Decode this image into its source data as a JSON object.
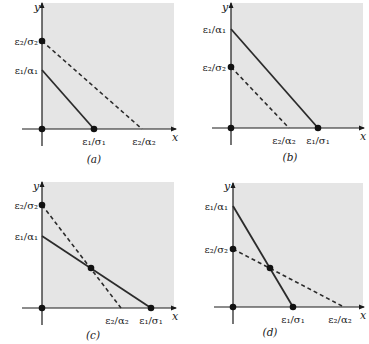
{
  "figure": {
    "background_color": "#ffffff",
    "region_color": "#e5e5e5",
    "line_color": "#2b2b2b",
    "axis_color": "#1a1a1a",
    "x_axis_label": "x",
    "y_axis_label": "y"
  },
  "chart_data": [
    {
      "type": "line",
      "panel": "a",
      "caption": "(a)",
      "xlabel": "x",
      "ylabel": "y",
      "y_tick_labels": [
        "ε₂/σ₂",
        "ε₁/α₁"
      ],
      "x_tick_labels": [
        "ε₁/σ₁",
        "ε₂/α₂"
      ],
      "series": [
        {
          "name": "solid",
          "style": "solid",
          "from": {
            "x": 0,
            "y_label": "ε₁/α₁"
          },
          "to": {
            "x_label": "ε₁/σ₁",
            "y": 0
          }
        },
        {
          "name": "dashed",
          "style": "dashed",
          "from": {
            "x": 0,
            "y_label": "ε₂/σ₂"
          },
          "to": {
            "x_label": "ε₂/α₂",
            "y": 0
          }
        }
      ],
      "dots": [
        "origin",
        "ε₂/σ₂ on y-axis",
        "ε₁/σ₁ on x-axis"
      ]
    },
    {
      "type": "line",
      "panel": "b",
      "caption": "(b)",
      "xlabel": "x",
      "ylabel": "y",
      "y_tick_labels": [
        "ε₁/α₁",
        "ε₂/σ₂"
      ],
      "x_tick_labels": [
        "ε₂/α₂",
        "ε₁/σ₁"
      ],
      "series": [
        {
          "name": "solid",
          "style": "solid",
          "from": {
            "x": 0,
            "y_label": "ε₁/α₁"
          },
          "to": {
            "x_label": "ε₁/σ₁",
            "y": 0
          }
        },
        {
          "name": "dashed",
          "style": "dashed",
          "from": {
            "x": 0,
            "y_label": "ε₂/σ₂"
          },
          "to": {
            "x_label": "ε₂/α₂",
            "y": 0
          }
        }
      ],
      "dots": [
        "origin",
        "ε₂/σ₂ on y-axis",
        "ε₁/σ₁ on x-axis"
      ]
    },
    {
      "type": "line",
      "panel": "c",
      "caption": "(c)",
      "xlabel": "x",
      "ylabel": "y",
      "y_tick_labels": [
        "ε₂/σ₂",
        "ε₁/α₁"
      ],
      "x_tick_labels": [
        "ε₂/α₂",
        "ε₁/σ₁"
      ],
      "series": [
        {
          "name": "solid",
          "style": "solid",
          "from": {
            "x": 0,
            "y_label": "ε₁/α₁"
          },
          "to": {
            "x_label": "ε₁/σ₁",
            "y": 0
          }
        },
        {
          "name": "dashed",
          "style": "dashed",
          "from": {
            "x": 0,
            "y_label": "ε₂/σ₂"
          },
          "to": {
            "x_label": "ε₂/α₂",
            "y": 0
          }
        }
      ],
      "dots": [
        "origin",
        "ε₂/σ₂ on y-axis",
        "intersection",
        "ε₁/σ₁ on x-axis"
      ]
    },
    {
      "type": "line",
      "panel": "d",
      "caption": "(d)",
      "xlabel": "x",
      "ylabel": "y",
      "y_tick_labels": [
        "ε₁/α₁",
        "ε₂/σ₂"
      ],
      "x_tick_labels": [
        "ε₁/σ₁",
        "ε₂/α₂"
      ],
      "series": [
        {
          "name": "solid",
          "style": "solid",
          "from": {
            "x": 0,
            "y_label": "ε₁/α₁"
          },
          "to": {
            "x_label": "ε₁/σ₁",
            "y": 0
          }
        },
        {
          "name": "dashed",
          "style": "dashed",
          "from": {
            "x": 0,
            "y_label": "ε₂/σ₂"
          },
          "to": {
            "x_label": "ε₂/α₂",
            "y": 0
          }
        }
      ],
      "dots": [
        "origin",
        "ε₂/σ₂ on y-axis",
        "intersection",
        "ε₁/σ₁ on x-axis"
      ]
    }
  ],
  "panels": [
    {
      "id": "a",
      "caption": "(a)",
      "origin": [
        42,
        129
      ],
      "region": {
        "x": 42,
        "y": 3,
        "w": 132,
        "h": 126
      },
      "x_axis": {
        "x1": 22,
        "x2": 176
      },
      "y_axis": {
        "y1": 3,
        "y2": 146
      },
      "solid": {
        "x1": 42,
        "y1": 70,
        "x2": 94,
        "y2": 129
      },
      "dashed": {
        "x1": 42,
        "y1": 41,
        "x2": 142,
        "y2": 129
      },
      "dots": [
        [
          42,
          129
        ],
        [
          42,
          41
        ],
        [
          94,
          129
        ]
      ],
      "y_labels": [
        {
          "text": "ε₂/σ₂",
          "x": 38,
          "y": 45
        },
        {
          "text": "ε₁/α₁",
          "x": 38,
          "y": 74
        }
      ],
      "x_labels": [
        {
          "text": "ε₁/σ₁",
          "x": 94,
          "y": 145
        },
        {
          "text": "ε₂/α₂",
          "x": 144,
          "y": 145
        }
      ],
      "x_name": {
        "text": "x",
        "x": 172,
        "y": 141
      },
      "y_name": {
        "text": "y",
        "x": 34,
        "y": 11
      },
      "caption_pos": {
        "x": 94,
        "y": 163
      }
    },
    {
      "id": "b",
      "caption": "(b)",
      "origin": [
        231,
        128
      ],
      "region": {
        "x": 231,
        "y": 3,
        "w": 132,
        "h": 125
      },
      "x_axis": {
        "x1": 212,
        "x2": 364
      },
      "y_axis": {
        "y1": 3,
        "y2": 145
      },
      "solid": {
        "x1": 231,
        "y1": 29,
        "x2": 318,
        "y2": 128
      },
      "dashed": {
        "x1": 231,
        "y1": 67,
        "x2": 289,
        "y2": 128
      },
      "dots": [
        [
          231,
          128
        ],
        [
          231,
          67
        ],
        [
          318,
          128
        ]
      ],
      "y_labels": [
        {
          "text": "ε₁/α₁",
          "x": 226,
          "y": 33
        },
        {
          "text": "ε₂/σ₂",
          "x": 226,
          "y": 71
        }
      ],
      "x_labels": [
        {
          "text": "ε₂/α₂",
          "x": 284,
          "y": 144
        },
        {
          "text": "ε₁/σ₁",
          "x": 318,
          "y": 144
        }
      ],
      "x_name": {
        "text": "x",
        "x": 360,
        "y": 140
      },
      "y_name": {
        "text": "y",
        "x": 222,
        "y": 11
      },
      "caption_pos": {
        "x": 290,
        "y": 161
      }
    },
    {
      "id": "c",
      "caption": "(c)",
      "origin": [
        42,
        308
      ],
      "region": {
        "x": 42,
        "y": 182,
        "w": 132,
        "h": 126
      },
      "x_axis": {
        "x1": 22,
        "x2": 176
      },
      "y_axis": {
        "y1": 182,
        "y2": 325
      },
      "solid": {
        "x1": 42,
        "y1": 236,
        "x2": 151,
        "y2": 308
      },
      "dashed": {
        "x1": 42,
        "y1": 205,
        "x2": 121,
        "y2": 308
      },
      "dots": [
        [
          42,
          308
        ],
        [
          42,
          205
        ],
        [
          91,
          268
        ],
        [
          151,
          308
        ]
      ],
      "y_labels": [
        {
          "text": "ε₂/σ₂",
          "x": 38,
          "y": 209
        },
        {
          "text": "ε₁/α₁",
          "x": 38,
          "y": 240
        }
      ],
      "x_labels": [
        {
          "text": "ε₂/α₂",
          "x": 117,
          "y": 324
        },
        {
          "text": "ε₁/σ₁",
          "x": 151,
          "y": 324
        }
      ],
      "x_name": {
        "text": "x",
        "x": 172,
        "y": 320
      },
      "y_name": {
        "text": "y",
        "x": 33,
        "y": 190
      },
      "caption_pos": {
        "x": 93,
        "y": 339
      }
    },
    {
      "id": "d",
      "caption": "(d)",
      "origin": [
        233,
        307
      ],
      "region": {
        "x": 233,
        "y": 183,
        "w": 130,
        "h": 124
      },
      "x_axis": {
        "x1": 214,
        "x2": 364
      },
      "y_axis": {
        "y1": 183,
        "y2": 324
      },
      "solid": {
        "x1": 233,
        "y1": 206,
        "x2": 293,
        "y2": 307
      },
      "dashed": {
        "x1": 233,
        "y1": 249,
        "x2": 344,
        "y2": 307
      },
      "dots": [
        [
          233,
          307
        ],
        [
          233,
          249
        ],
        [
          270,
          268
        ],
        [
          293,
          307
        ]
      ],
      "y_labels": [
        {
          "text": "ε₁/α₁",
          "x": 228,
          "y": 210
        },
        {
          "text": "ε₂/σ₂",
          "x": 228,
          "y": 253
        }
      ],
      "x_labels": [
        {
          "text": "ε₁/σ₁",
          "x": 293,
          "y": 323
        },
        {
          "text": "ε₂/α₂",
          "x": 340,
          "y": 323
        }
      ],
      "x_name": {
        "text": "x",
        "x": 360,
        "y": 319
      },
      "y_name": {
        "text": "y",
        "x": 224,
        "y": 190
      },
      "caption_pos": {
        "x": 270,
        "y": 336
      }
    }
  ]
}
